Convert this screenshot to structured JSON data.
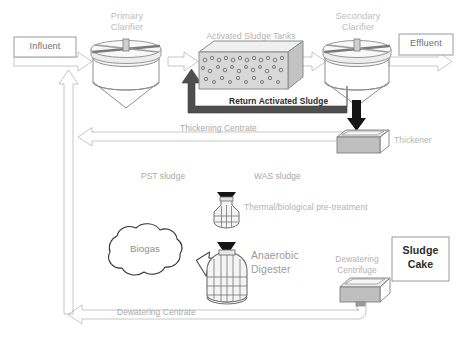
{
  "diagram": {
    "width": 462,
    "height": 350,
    "background": "#ffffff"
  },
  "boxes": {
    "influent": {
      "label": "Influent"
    },
    "effluent": {
      "label": "Effluent"
    },
    "sludge_cake": {
      "label_line1": "Sludge",
      "label_line2": "Cake"
    }
  },
  "units": {
    "primary_clarifier": {
      "label_line1": "Primary",
      "label_line2": "Clarifier"
    },
    "activated_sludge_tanks": {
      "label": "Activated Sludge Tanks"
    },
    "secondary_clarifier": {
      "label_line1": "Secondary",
      "label_line2": "Clarifier"
    },
    "thickener": {
      "label": "Thickener"
    },
    "pre_treatment": {
      "label": "Thermal/biological pre-treatment"
    },
    "anaerobic_digester": {
      "label_line1": "Anaerobic",
      "label_line2": "Digester"
    },
    "dewatering_centrifuge": {
      "label_line1": "Dewatering",
      "label_line2": "Centrifuge"
    },
    "biogas": {
      "label": "Biogas"
    }
  },
  "streams": {
    "return_activated_sludge": {
      "label": "Return Activated Sludge"
    },
    "thickening_centrate": {
      "label": "Thickening Centrate"
    },
    "pst_sludge": {
      "label": "PST sludge"
    },
    "was_sludge": {
      "label": "WAS sludge"
    },
    "dewatering_centrate": {
      "label": "Dewatering Centrate"
    }
  },
  "colors": {
    "grey_arrow": "#9a9a9a",
    "grey_arrow_dark": "#8a8a8a",
    "black_arrow": "#1a1a1a",
    "vessel_fill": "#efefef",
    "vessel_stroke": "#8c8c8c",
    "tank_fill": "#d6d6d6",
    "box_stroke": "#9a9a9a",
    "text_grey": "#b2b2b2",
    "text_dark": "#2b2b2b"
  }
}
